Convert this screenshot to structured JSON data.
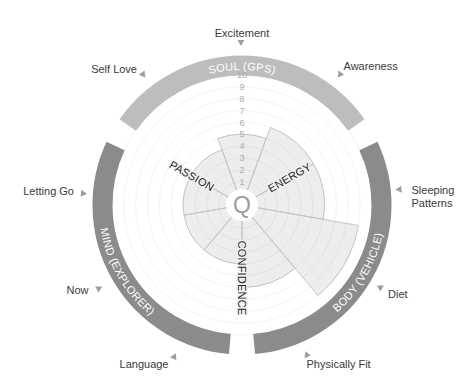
{
  "center_icon": {
    "glyph": "Q",
    "name": "q-logo-icon"
  },
  "sections": [
    {
      "id": "soul",
      "label": "SOUL (GPS)",
      "color": "#bdbdbd"
    },
    {
      "id": "body",
      "label": "BODY (VEHICLE)",
      "color": "#8b8b8b"
    },
    {
      "id": "mind",
      "label": "MIND (EXPLORER)",
      "color": "#8b8b8b"
    }
  ],
  "axis_labels": {
    "passion": "PASSION",
    "energy": "ENERGY",
    "confidence": "CONFIDENCE"
  },
  "outer_labels": {
    "excitement": "Excitement",
    "awareness": "Awareness",
    "sleeping_patterns": [
      "Sleeping",
      "Patterns"
    ],
    "diet": "Diet",
    "physically_fit": "Physically Fit",
    "language": "Language",
    "now": "Now",
    "letting_go": "Letting Go",
    "self_love": "Self Love"
  },
  "chart_data": {
    "type": "bar",
    "layout": "polar",
    "title": "",
    "categories": [
      "Excitement",
      "Awareness",
      "Sleeping Patterns",
      "Diet",
      "Physically Fit",
      "Language",
      "Now",
      "Letting Go",
      "Self Love"
    ],
    "values": [
      5,
      6,
      6,
      9,
      6,
      4,
      4,
      4,
      4
    ],
    "groups": [
      {
        "name": "SOUL (GPS)",
        "categories": [
          "Self Love",
          "Excitement",
          "Awareness"
        ]
      },
      {
        "name": "BODY (VEHICLE)",
        "categories": [
          "Sleeping Patterns",
          "Diet",
          "Physically Fit"
        ]
      },
      {
        "name": "MIND (EXPLORER)",
        "categories": [
          "Language",
          "Now",
          "Letting Go"
        ]
      }
    ],
    "axis_labels": [
      "PASSION",
      "ENERGY",
      "CONFIDENCE"
    ],
    "rticks": [
      1,
      2,
      3,
      4,
      5,
      6,
      7,
      8,
      9,
      10
    ],
    "rlim": [
      0,
      10
    ],
    "grid": true,
    "legend": "none",
    "sectors": [
      {
        "category": "Excitement",
        "theta_start": 340,
        "theta_span": 40,
        "value": 5
      },
      {
        "category": "Awareness",
        "theta_start": 20,
        "theta_span": 40,
        "value": 6
      },
      {
        "category": "Sleeping Patterns",
        "theta_start": 60,
        "theta_span": 40,
        "value": 6
      },
      {
        "category": "Diet",
        "theta_start": 100,
        "theta_span": 40,
        "value": 9
      },
      {
        "category": "Physically Fit",
        "theta_start": 140,
        "theta_span": 40,
        "value": 6
      },
      {
        "category": "Language",
        "theta_start": 180,
        "theta_span": 40,
        "value": 4
      },
      {
        "category": "Now",
        "theta_start": 220,
        "theta_span": 40,
        "value": 4
      },
      {
        "category": "Letting Go",
        "theta_start": 260,
        "theta_span": 40,
        "value": 4
      },
      {
        "category": "Self Love",
        "theta_start": 300,
        "theta_span": 40,
        "value": 4
      }
    ],
    "colors": {
      "wedge_fill": "#ededed",
      "wedge_stroke": "#c2c2c2",
      "grid": "#e4e4e4"
    }
  }
}
